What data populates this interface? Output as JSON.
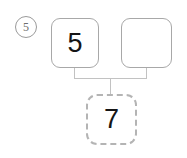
{
  "problem": {
    "number_label": "5",
    "type": "number-bond"
  },
  "colors": {
    "background": "#ffffff",
    "box_border": "#a8a8a8",
    "dashed_border": "#b4b4b4",
    "connector": "#c2c2c2",
    "digit": "#151515",
    "problem_number": "#6e6e6e"
  },
  "number_bond": {
    "parts": [
      {
        "name": "left-part",
        "value": "5",
        "filled": true
      },
      {
        "name": "right-part",
        "value": "",
        "filled": false
      }
    ],
    "whole": {
      "name": "whole",
      "value": "7",
      "filled": true,
      "border": "dashed"
    }
  }
}
